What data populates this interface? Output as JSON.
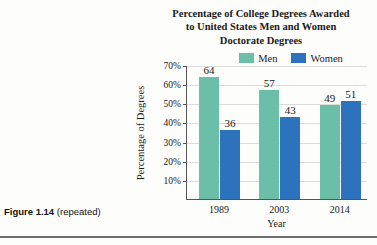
{
  "figure": {
    "caption_label": "Figure 1.14",
    "caption_note": "(repeated)"
  },
  "chart_data": {
    "type": "bar",
    "title": "Percentage of College Degrees Awarded to United States Men and Women",
    "title_line1": "Percentage of College Degrees Awarded",
    "title_line2": "to United States Men and Women",
    "subtitle": "Doctorate Degrees",
    "xlabel": "Year",
    "ylabel": "Percentage of Degrees",
    "categories": [
      "1989",
      "2003",
      "2014"
    ],
    "series": [
      {
        "name": "Men",
        "values": [
          64,
          57,
          49
        ],
        "color": "#6bbfa8"
      },
      {
        "name": "Women",
        "values": [
          36,
          43,
          51
        ],
        "color": "#2d72bd"
      }
    ],
    "ylim": [
      0,
      70
    ],
    "ytick_labels": [
      "70%",
      "60%",
      "50%",
      "40%",
      "30%",
      "20%",
      "10%"
    ],
    "ytick_values": [
      70,
      60,
      50,
      40,
      30,
      20,
      10
    ],
    "grid": true,
    "legend_position": "top"
  }
}
